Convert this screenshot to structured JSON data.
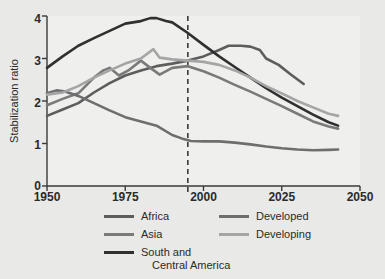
{
  "chart_data": {
    "type": "line",
    "title": "",
    "subtitle": "",
    "xlabel": "",
    "ylabel": "Stabilization ratio",
    "xlim": [
      1950,
      2050
    ],
    "ylim": [
      0,
      4
    ],
    "xticks": [
      1950,
      1975,
      2000,
      2025,
      2050
    ],
    "xtick_labels": [
      "1950",
      "1975",
      "2000",
      "2025",
      "2050"
    ],
    "yticks": [
      0,
      1,
      2,
      3,
      4
    ],
    "ytick_labels": [
      "0",
      "1",
      "2",
      "3",
      "4"
    ],
    "grid": false,
    "legend_position": "below",
    "annotations": [
      {
        "type": "vertical-dashed-line",
        "x": 1995,
        "label": ""
      }
    ],
    "series": [
      {
        "name": "Africa",
        "color": "#5d5d5d",
        "x": [
          1950,
          1955,
          1960,
          1965,
          1970,
          1975,
          1980,
          1985,
          1990,
          1995,
          2000,
          2005,
          2008,
          2012,
          2015,
          2018,
          2020,
          2024,
          2028,
          2032
        ],
        "values": [
          1.65,
          1.8,
          1.95,
          2.2,
          2.42,
          2.6,
          2.72,
          2.82,
          2.88,
          2.95,
          3.05,
          3.2,
          3.3,
          3.3,
          3.28,
          3.2,
          3.0,
          2.85,
          2.62,
          2.4
        ]
      },
      {
        "name": "Asia",
        "color": "#7a7a7a",
        "x": [
          1950,
          1955,
          1960,
          1965,
          1968,
          1970,
          1973,
          1976,
          1980,
          1983,
          1986,
          1990,
          1995,
          2000,
          2005,
          2010,
          2015,
          2020,
          2025,
          2030,
          2035,
          2040,
          2043
        ],
        "values": [
          1.9,
          2.05,
          2.18,
          2.55,
          2.72,
          2.78,
          2.6,
          2.72,
          2.95,
          2.78,
          2.62,
          2.78,
          2.82,
          2.7,
          2.55,
          2.38,
          2.22,
          2.05,
          1.88,
          1.7,
          1.52,
          1.4,
          1.35
        ]
      },
      {
        "name": "South and Central America",
        "color": "#303030",
        "x": [
          1950,
          1955,
          1960,
          1965,
          1970,
          1975,
          1980,
          1983,
          1985,
          1988,
          1990,
          1995,
          2000,
          2005,
          2010,
          2015,
          2020,
          2025,
          2030,
          2035,
          2040,
          2043
        ],
        "values": [
          2.78,
          3.05,
          3.3,
          3.48,
          3.65,
          3.82,
          3.88,
          3.95,
          3.95,
          3.88,
          3.85,
          3.6,
          3.32,
          3.05,
          2.8,
          2.55,
          2.3,
          2.08,
          1.88,
          1.68,
          1.5,
          1.42
        ]
      },
      {
        "name": "Developed",
        "color": "#6e6e6e",
        "x": [
          1950,
          1953,
          1956,
          1960,
          1965,
          1970,
          1975,
          1980,
          1985,
          1990,
          1993,
          1996,
          2000,
          2005,
          2010,
          2015,
          2020,
          2025,
          2030,
          2035,
          2040,
          2043
        ],
        "values": [
          2.18,
          2.25,
          2.22,
          2.12,
          1.95,
          1.78,
          1.62,
          1.52,
          1.42,
          1.2,
          1.12,
          1.06,
          1.05,
          1.05,
          1.02,
          0.98,
          0.93,
          0.89,
          0.86,
          0.84,
          0.85,
          0.86
        ]
      },
      {
        "name": "Developing",
        "color": "#a5a5a5",
        "x": [
          1950,
          1955,
          1960,
          1965,
          1970,
          1975,
          1980,
          1984,
          1986,
          1990,
          1995,
          2000,
          2005,
          2010,
          2015,
          2020,
          2025,
          2030,
          2035,
          2040,
          2043
        ],
        "values": [
          2.15,
          2.2,
          2.35,
          2.55,
          2.72,
          2.88,
          3.0,
          3.22,
          3.02,
          2.98,
          2.95,
          2.92,
          2.85,
          2.72,
          2.55,
          2.35,
          2.18,
          2.0,
          1.85,
          1.7,
          1.65
        ]
      }
    ]
  },
  "axis": {
    "ylabel": "Stabilization ratio",
    "ytick_0": "0",
    "ytick_1": "1",
    "ytick_2": "2",
    "ytick_3": "3",
    "ytick_4": "4",
    "xtick_0": "1950",
    "xtick_1": "1975",
    "xtick_2": "2000",
    "xtick_3": "2025",
    "xtick_4": "2050"
  },
  "legend": {
    "entries": [
      {
        "label": "Africa",
        "color": "#5d5d5d"
      },
      {
        "label": "Asia",
        "color": "#7a7a7a"
      },
      {
        "label": "South and",
        "color": "#303030"
      },
      {
        "label": "Central America",
        "color": "#303030"
      },
      {
        "label": "Developed",
        "color": "#6e6e6e"
      },
      {
        "label": "Developing",
        "color": "#a5a5a5"
      }
    ]
  },
  "style": {
    "background": "#e9e9e7",
    "plot_background": "#eeeeec",
    "axis_color": "#3a3a3a",
    "dashed_line_color": "#2e2e2e"
  }
}
